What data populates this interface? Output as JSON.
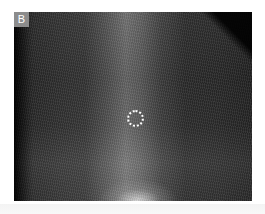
{
  "figure": {
    "panel_label": "B",
    "marker": {
      "shape": "dotted-circle",
      "color": "#ffffff"
    },
    "colors": {
      "label_background": "#8c8c8c",
      "label_text": "#ffffff",
      "image_base": "#2a2a2a"
    }
  }
}
